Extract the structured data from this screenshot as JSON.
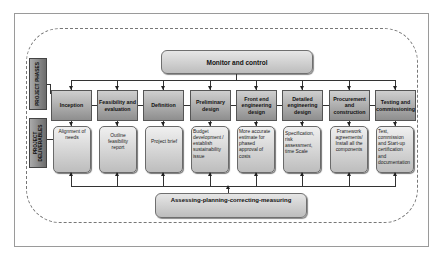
{
  "diagram": {
    "top_box": "Monitor and control",
    "bottom_box": "Assessing-planning-correcting-measuring",
    "side_labels": {
      "phases": "PROJECT PHASES",
      "deliverables_line1": "PROJECT",
      "deliverables_line2": "DELIVERABLES"
    },
    "phases": [
      {
        "label": "Inception",
        "deliverable": "Alignment of needs"
      },
      {
        "label": "Feasibility and evaluation",
        "deliverable": "Outline feasibility report"
      },
      {
        "label": "Definition",
        "deliverable": "Project brief"
      },
      {
        "label": "Preliminary design",
        "deliverable": "Budget development / establish sustainability issue"
      },
      {
        "label": "Front end engineering design",
        "deliverable": "More accurate estimate for phased approval of costs"
      },
      {
        "label": "Detailed engineering design",
        "deliverable": "Specification, risk assessment, time Scale"
      },
      {
        "label": "Procurement and construction",
        "deliverable": "Framework agreements/ Install all the components"
      },
      {
        "label": "Testing and commissioning",
        "deliverable": "Test, commission and Start-up certification and documentation"
      }
    ]
  }
}
